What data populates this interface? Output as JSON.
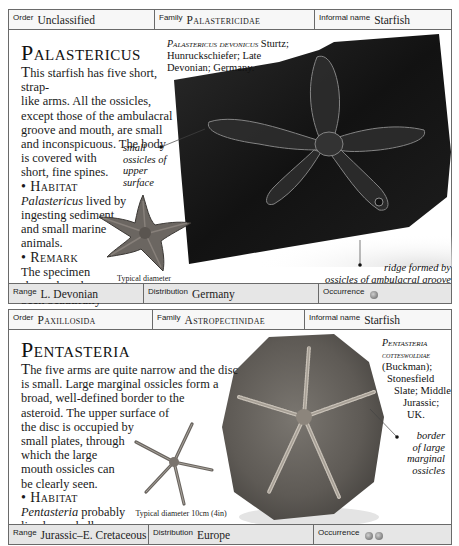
{
  "entries": [
    {
      "header": {
        "order_label": "Order",
        "order_value": "Unclassified",
        "family_label": "Family",
        "family_value": "Palastericidae",
        "informal_label": "Informal name",
        "informal_value": "Starfish"
      },
      "title": "Palastericus",
      "description_lines": [
        "his starfish has five short, strap-",
        "like arms. All the ossicles,",
        "except those of the ambulacral",
        "groove and mouth, are small",
        "and inconspicuous. The body",
        "is covered with",
        "short, fine spines."
      ],
      "dropcap": "T",
      "habitat_heading": "• Habitat",
      "habitat_italic": "Palastericus",
      "habitat_lines": [
        " lived by",
        "ingesting sediment",
        "and small marine",
        "animals."
      ],
      "remark_heading": "• Remark",
      "remark_lines": [
        "The specimen",
        "shown here has",
        "been beautifully",
        "preserved in",
        "iron pyrites."
      ],
      "specimen_caption": {
        "sci_name": "Palastericus devonicus",
        "lines": [
          " Sturtz;",
          "Hunruckschiefer; Late",
          "Devonian; Germany."
        ]
      },
      "annotations": [
        {
          "text_lines": [
            "small",
            "ossicles of",
            "upper",
            "surface"
          ]
        },
        {
          "text_lines": [
            "ridge formed by",
            "ossicles of ambulacral groove"
          ]
        }
      ],
      "diameter_lines": [
        "Typical diameter",
        "12cm (5in)"
      ],
      "footer": {
        "range_label": "Range",
        "range_value": "L. Devonian",
        "distribution_label": "Distribution",
        "distribution_value": "Germany",
        "occurrence_label": "Occurrence",
        "occurrence_count": 1
      }
    },
    {
      "header": {
        "order_label": "Order",
        "order_value": "Paxillosida",
        "family_label": "Family",
        "family_value": "Astropectinidae",
        "informal_label": "Informal name",
        "informal_value": "Starfish"
      },
      "title": "Pentasteria",
      "dropcap": "T",
      "description_lines": [
        "he five arms are quite narrow and the disc",
        "is small. Large marginal ossicles form a",
        "broad, well-defined border to the",
        "asteroid. The upper surface of",
        "the disc is occupied by",
        "small plates, through",
        "which the large",
        "mouth ossicles can",
        "be clearly seen."
      ],
      "habitat_heading": "• Habitat",
      "habitat_italic": "Pentasteria",
      "habitat_lines": [
        " probably",
        "lived as a shallow",
        "burrower in sand."
      ],
      "specimen_caption": {
        "sci_name_lines": [
          "Pentasteria",
          "cotteswoldiae"
        ],
        "lines": [
          "(Buckman);",
          "Stonesfield",
          "Slate; Middle",
          "Jurassic;",
          "UK."
        ]
      },
      "annotations": [
        {
          "text_lines": [
            "border",
            "of large",
            "marginal",
            "ossicles"
          ]
        }
      ],
      "diameter_lines": [
        "Typical diameter 10cm (4in)"
      ],
      "footer": {
        "range_label": "Range",
        "range_value": "Jurassic–E. Cretaceous",
        "distribution_label": "Distribution",
        "distribution_value": "Europe",
        "occurrence_label": "Occurrence",
        "occurrence_count": 2
      }
    }
  ],
  "colors": {
    "border": "#6a6a6a",
    "header_bg": "#f7f7f7",
    "footer_bg": "#e6e6e6",
    "slab_dark": "#141414",
    "rock_gray": "#6e6b66",
    "pyrite_starfish": "#6b6661"
  }
}
